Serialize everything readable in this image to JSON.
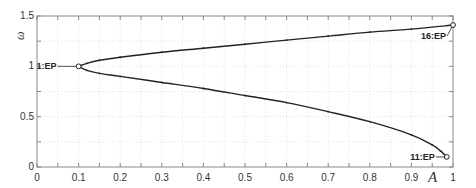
{
  "chart_data": {
    "type": "line",
    "title": "",
    "xlabel": "A",
    "ylabel": "ω",
    "xlim": [
      0,
      1
    ],
    "ylim": [
      0,
      1.5
    ],
    "grid": true,
    "legend": null,
    "x_ticks": [
      "0",
      "0.1",
      "0.2",
      "0.3",
      "0.4",
      "0.5",
      "0.6",
      "0.7",
      "0.8",
      "0.9",
      "1"
    ],
    "y_ticks": [
      "0",
      "0.5",
      "1",
      "1.5"
    ],
    "series": [
      {
        "name": "upper branch",
        "x": [
          0.1,
          0.12,
          0.15,
          0.2,
          0.3,
          0.4,
          0.5,
          0.6,
          0.7,
          0.8,
          0.9,
          1.0
        ],
        "y": [
          1.0,
          1.03,
          1.06,
          1.09,
          1.14,
          1.18,
          1.22,
          1.26,
          1.3,
          1.34,
          1.37,
          1.41
        ]
      },
      {
        "name": "lower branch",
        "x": [
          0.1,
          0.12,
          0.15,
          0.2,
          0.3,
          0.4,
          0.5,
          0.6,
          0.7,
          0.8,
          0.9,
          0.95,
          0.97,
          0.985
        ],
        "y": [
          1.0,
          0.96,
          0.93,
          0.9,
          0.84,
          0.78,
          0.71,
          0.64,
          0.55,
          0.45,
          0.32,
          0.22,
          0.16,
          0.1
        ]
      }
    ],
    "annotations": [
      {
        "label": "1:EP",
        "x": 0.1,
        "y": 1.0
      },
      {
        "label": "11:EP",
        "x": 0.985,
        "y": 0.1
      },
      {
        "label": "16:EP",
        "x": 1.0,
        "y": 1.41
      }
    ]
  },
  "colors": {
    "curve": "#222222",
    "axis": "#888888",
    "grid": "#dddddd",
    "text": "#333333"
  }
}
